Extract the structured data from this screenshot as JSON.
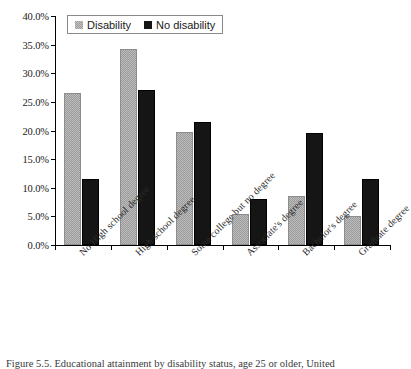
{
  "caption": {
    "text": "Figure 5.5.  Educational attainment by disability status, age 25 or older, United"
  },
  "legend": {
    "position": "top-left-inside",
    "entries": [
      {
        "label": "Disability",
        "color": "#9a9a9a",
        "swatch": "gray-checker-swatch"
      },
      {
        "label": "No disability",
        "color": "#151515",
        "swatch": "black-swatch"
      }
    ]
  },
  "axis": {
    "y_ticks": [
      "0.0%",
      "5.0%",
      "10.0%",
      "15.0%",
      "20.0%",
      "25.0%",
      "30.0%",
      "35.0%",
      "40.0%"
    ]
  },
  "chart_data": {
    "type": "bar",
    "title": "",
    "xlabel": "",
    "ylabel": "",
    "ylim": [
      0,
      40
    ],
    "ytick_values": [
      0,
      5,
      10,
      15,
      20,
      25,
      30,
      35,
      40
    ],
    "ytick_labels": [
      "0.0%",
      "5.0%",
      "10.0%",
      "15.0%",
      "20.0%",
      "25.0%",
      "30.0%",
      "35.0%",
      "40.0%"
    ],
    "grid": false,
    "legend_position": "upper left",
    "categories": [
      "No High school degree",
      "High school degree",
      "Some college but no degree",
      "Associate's degree",
      "Bachelor's degree",
      "Graduate degree"
    ],
    "series": [
      {
        "name": "Disability",
        "color": "#9a9a9a",
        "values": [
          26.6,
          34.3,
          19.8,
          5.5,
          8.6,
          5.0
        ]
      },
      {
        "name": "No disability",
        "color": "#151515",
        "values": [
          11.6,
          27.1,
          21.5,
          8.1,
          19.6,
          11.6
        ]
      }
    ]
  }
}
